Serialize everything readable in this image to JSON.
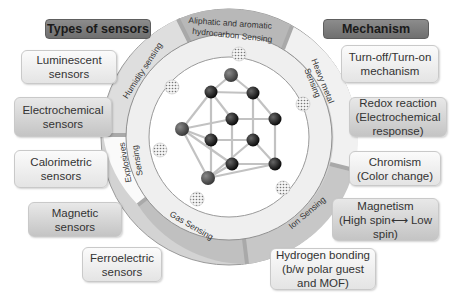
{
  "left_panel": {
    "header": "Types of sensors",
    "items": [
      {
        "label": "Luminescent\nsensors"
      },
      {
        "label": "Electrochemical\nsensors"
      },
      {
        "label": "Calorimetric\nsensors"
      },
      {
        "label": "Magnetic\nsensors"
      },
      {
        "label": "Ferroelectric\nsensors"
      }
    ]
  },
  "right_panel": {
    "header": "Mechanism",
    "items": [
      {
        "label": "Turn-off/Turn-on\nmechanism"
      },
      {
        "label": "Redox reaction\n(Electrochemical\nresponse)"
      },
      {
        "label": "Chromism\n(Color change)"
      },
      {
        "label": "Magnetism\n(High spin⟷ Low\nspin)"
      },
      {
        "label": "Hydrogen bonding\n(b/w polar guest\nand MOF)"
      }
    ]
  },
  "ring": {
    "segments": [
      {
        "label": "Aliphatic and aromatic",
        "label2": "hydrocarbon  Sensing"
      },
      {
        "label": "Heavy metal",
        "label2": "Sensing"
      },
      {
        "label": "Ion Sensing"
      },
      {
        "label": "Gas Sensing"
      },
      {
        "label": "Explosives",
        "label2": "Sensing"
      },
      {
        "label": "Humidity sensing"
      }
    ]
  },
  "colors": {
    "ring_dark": "#b9b9b9",
    "ring_light": "#ececec",
    "atom_dark": "#111111",
    "atom_grey": "#555555",
    "bond": "#bdbdbd"
  }
}
